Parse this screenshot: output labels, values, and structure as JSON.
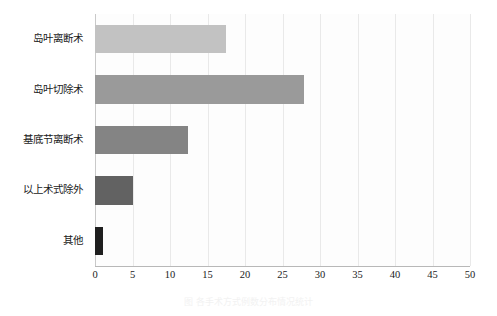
{
  "chart_data": {
    "type": "bar",
    "orientation": "horizontal",
    "title": "",
    "subtitle": "",
    "xlabel": "",
    "ylabel": "",
    "categories": [
      "岛叶离断术",
      "岛叶切除术",
      "基底节离断术",
      "以上术式除外",
      "其他"
    ],
    "values": [
      17.5,
      27.8,
      12.4,
      5.0,
      1.0
    ],
    "bar_colors": [
      "#c2c2c2",
      "#9a9a9a",
      "#848484",
      "#626262",
      "#1f1f1f"
    ],
    "xlim": [
      0,
      50
    ],
    "ylim": null,
    "xticks": [
      0,
      5,
      10,
      15,
      20,
      25,
      30,
      35,
      40,
      45,
      50
    ],
    "xtick_labels": [
      "0",
      "5",
      "10",
      "15",
      "20",
      "25",
      "30",
      "35",
      "40",
      "45",
      "50"
    ],
    "grid": true,
    "grid_axis": "x",
    "legend": false,
    "legend_position": "none",
    "background": "#ffffff",
    "plot_background": "#fdfdfd",
    "axis_color": "#b8b8b8",
    "gridline_color": "#e9e9e9",
    "text_color": "#1a1a1a"
  },
  "figure": {
    "caption": "图  各手术方式例数分布情况统计"
  }
}
